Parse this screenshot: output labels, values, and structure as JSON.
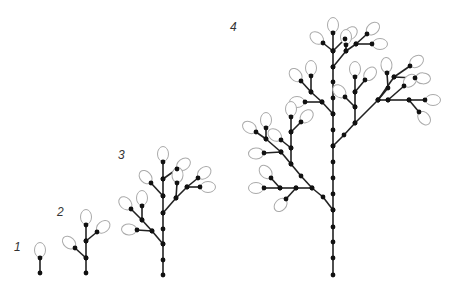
{
  "figure": {
    "stages": [
      {
        "label": "1",
        "x": 14,
        "y": 240
      },
      {
        "label": "2",
        "x": 57,
        "y": 205
      },
      {
        "label": "3",
        "x": 118,
        "y": 148
      },
      {
        "label": "4",
        "x": 230,
        "y": 20
      }
    ],
    "colors": {
      "stem": "#222222",
      "node": "#111111",
      "bud_stroke": "#aaaaaa",
      "bud_fill": "#ffffff"
    }
  }
}
